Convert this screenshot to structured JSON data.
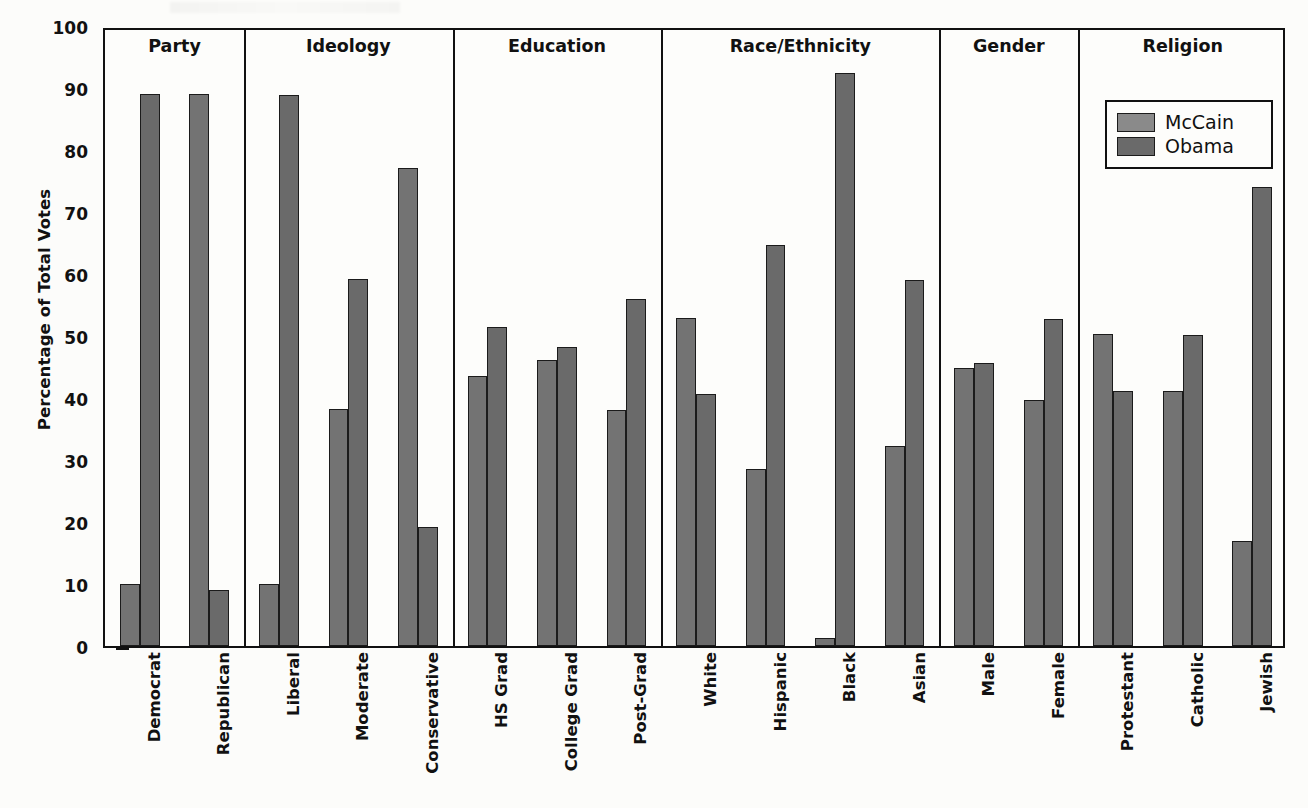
{
  "chart_data": {
    "type": "bar",
    "title": "",
    "xlabel": "",
    "ylabel": "Percentage of Total Votes",
    "ylim": [
      0,
      100
    ],
    "yticks": [
      0,
      10,
      20,
      30,
      40,
      50,
      60,
      70,
      80,
      90,
      100
    ],
    "grid": false,
    "legend_position": "top-right",
    "legend": [
      "McCain",
      "Obama"
    ],
    "categories": [
      "Democrat",
      "Republican",
      "Liberal",
      "Moderate",
      "Conservative",
      "HS Grad",
      "College Grad",
      "Post-Grad",
      "White",
      "Hispanic",
      "Black",
      "Asian",
      "Male",
      "Female",
      "Protestant",
      "Catholic",
      "Jewish"
    ],
    "series": [
      {
        "name": "McCain",
        "values": [
          10.0,
          89.0,
          10.0,
          38.3,
          77.1,
          43.5,
          46.2,
          38.0,
          52.9,
          28.6,
          1.3,
          32.2,
          44.9,
          39.7,
          50.4,
          41.2,
          17.0
        ]
      },
      {
        "name": "Obama",
        "values": [
          89.0,
          9.0,
          88.8,
          59.2,
          19.2,
          51.4,
          48.2,
          55.9,
          40.7,
          64.6,
          92.4,
          59.1,
          45.7,
          52.7,
          41.2,
          50.2,
          74.1
        ]
      }
    ],
    "groups": [
      {
        "label": "Party",
        "categories": [
          "Democrat",
          "Republican"
        ]
      },
      {
        "label": "Ideology",
        "categories": [
          "Liberal",
          "Moderate",
          "Conservative"
        ]
      },
      {
        "label": "Education",
        "categories": [
          "HS Grad",
          "College Grad",
          "Post-Grad"
        ]
      },
      {
        "label": "Race/Ethnicity",
        "categories": [
          "White",
          "Hispanic",
          "Black",
          "Asian"
        ]
      },
      {
        "label": "Gender",
        "categories": [
          "Male",
          "Female"
        ]
      },
      {
        "label": "Religion",
        "categories": [
          "Protestant",
          "Catholic",
          "Jewish"
        ]
      }
    ],
    "colors": {
      "mccain": "#8a8a8a",
      "obama": "#6a6a6a",
      "axis": "#111111",
      "background": "#fdfdfb"
    }
  }
}
